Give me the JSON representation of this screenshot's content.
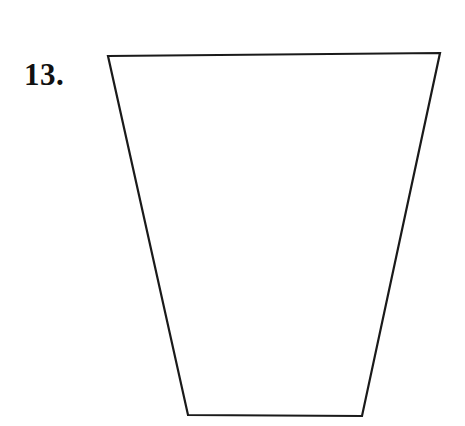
{
  "page": {
    "background_color": "#ffffff",
    "width": 465,
    "height": 426
  },
  "problem": {
    "number_label": "13."
  },
  "figure": {
    "name": "trapezoid",
    "shape_type": "quadrilateral-trapezoid",
    "orientation": "inverted (wider at top, narrower at bottom)",
    "stroke_color": "#1a1a1a",
    "stroke_width": 2.2,
    "fill_color": "none",
    "vertices": {
      "top_left": {
        "x": 108,
        "y": 56
      },
      "top_right": {
        "x": 440,
        "y": 53
      },
      "bottom_right": {
        "x": 362,
        "y": 416
      },
      "bottom_left": {
        "x": 188,
        "y": 415
      }
    },
    "points_attr": "108,56 440,53 362,416 188,415",
    "edges": [
      {
        "name": "top-edge",
        "from": "top_left",
        "to": "top_right"
      },
      {
        "name": "right-leg",
        "from": "top_right",
        "to": "bottom_right"
      },
      {
        "name": "bottom-edge",
        "from": "bottom_right",
        "to": "bottom_left"
      },
      {
        "name": "left-leg",
        "from": "bottom_left",
        "to": "top_left"
      }
    ]
  }
}
